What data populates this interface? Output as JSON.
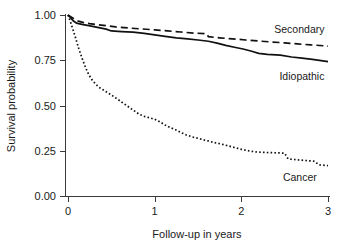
{
  "figure": {
    "background_color": "#ffffff",
    "line_color": "#111111"
  },
  "chart_data": {
    "type": "line",
    "title": "",
    "xlabel": "Follow-up in years",
    "ylabel": "Survival probability",
    "xlim": [
      0,
      3
    ],
    "ylim": [
      0,
      1
    ],
    "xticks": [
      0,
      1,
      2,
      3
    ],
    "xticklabels": [
      "0",
      "1",
      "2",
      "3"
    ],
    "yticks": [
      0.0,
      0.25,
      0.5,
      0.75,
      1.0
    ],
    "yticklabels": [
      "0.00",
      "0.25",
      "0.50",
      "0.75",
      "1.00"
    ],
    "grid": false,
    "legend_position": "inline-annotations",
    "series": [
      {
        "name": "Secondary",
        "style": "dashed",
        "label_x": 2.38,
        "label_y": 0.925,
        "points": [
          [
            0.0,
            1.0
          ],
          [
            0.04,
            0.988
          ],
          [
            0.08,
            0.975
          ],
          [
            0.12,
            0.966
          ],
          [
            0.18,
            0.958
          ],
          [
            0.25,
            0.952
          ],
          [
            0.35,
            0.946
          ],
          [
            0.45,
            0.94
          ],
          [
            0.55,
            0.934
          ],
          [
            0.7,
            0.928
          ],
          [
            0.85,
            0.923
          ],
          [
            1.0,
            0.918
          ],
          [
            1.15,
            0.912
          ],
          [
            1.3,
            0.906
          ],
          [
            1.45,
            0.9
          ],
          [
            1.6,
            0.897
          ],
          [
            1.62,
            0.88
          ],
          [
            1.75,
            0.874
          ],
          [
            1.9,
            0.868
          ],
          [
            2.05,
            0.862
          ],
          [
            2.2,
            0.856
          ],
          [
            2.35,
            0.851
          ],
          [
            2.5,
            0.846
          ],
          [
            2.65,
            0.84
          ],
          [
            2.8,
            0.835
          ],
          [
            2.95,
            0.83
          ],
          [
            3.0,
            0.828
          ]
        ]
      },
      {
        "name": "Idiopathic",
        "style": "solid",
        "label_x": 2.44,
        "label_y": 0.665,
        "points": [
          [
            0.0,
            1.0
          ],
          [
            0.03,
            0.985
          ],
          [
            0.06,
            0.968
          ],
          [
            0.1,
            0.955
          ],
          [
            0.16,
            0.948
          ],
          [
            0.24,
            0.941
          ],
          [
            0.34,
            0.932
          ],
          [
            0.44,
            0.922
          ],
          [
            0.5,
            0.912
          ],
          [
            0.62,
            0.908
          ],
          [
            0.75,
            0.905
          ],
          [
            0.88,
            0.898
          ],
          [
            1.0,
            0.89
          ],
          [
            1.12,
            0.882
          ],
          [
            1.25,
            0.874
          ],
          [
            1.38,
            0.868
          ],
          [
            1.5,
            0.862
          ],
          [
            1.62,
            0.855
          ],
          [
            1.72,
            0.845
          ],
          [
            1.82,
            0.832
          ],
          [
            1.92,
            0.822
          ],
          [
            2.02,
            0.812
          ],
          [
            2.12,
            0.8
          ],
          [
            2.2,
            0.788
          ],
          [
            2.3,
            0.782
          ],
          [
            2.45,
            0.778
          ],
          [
            2.58,
            0.768
          ],
          [
            2.7,
            0.762
          ],
          [
            2.82,
            0.755
          ],
          [
            2.92,
            0.748
          ],
          [
            3.0,
            0.742
          ]
        ]
      },
      {
        "name": "Cancer",
        "style": "dotted",
        "label_x": 2.48,
        "label_y": 0.105,
        "points": [
          [
            0.0,
            1.0
          ],
          [
            0.03,
            0.96
          ],
          [
            0.06,
            0.915
          ],
          [
            0.09,
            0.87
          ],
          [
            0.12,
            0.82
          ],
          [
            0.16,
            0.765
          ],
          [
            0.2,
            0.712
          ],
          [
            0.24,
            0.67
          ],
          [
            0.28,
            0.64
          ],
          [
            0.32,
            0.618
          ],
          [
            0.36,
            0.6
          ],
          [
            0.4,
            0.588
          ],
          [
            0.46,
            0.57
          ],
          [
            0.52,
            0.552
          ],
          [
            0.58,
            0.532
          ],
          [
            0.64,
            0.512
          ],
          [
            0.7,
            0.492
          ],
          [
            0.76,
            0.472
          ],
          [
            0.82,
            0.452
          ],
          [
            0.88,
            0.44
          ],
          [
            0.94,
            0.432
          ],
          [
            1.0,
            0.424
          ],
          [
            1.06,
            0.41
          ],
          [
            1.12,
            0.392
          ],
          [
            1.18,
            0.378
          ],
          [
            1.24,
            0.366
          ],
          [
            1.3,
            0.352
          ],
          [
            1.36,
            0.338
          ],
          [
            1.44,
            0.326
          ],
          [
            1.52,
            0.316
          ],
          [
            1.6,
            0.306
          ],
          [
            1.68,
            0.296
          ],
          [
            1.76,
            0.288
          ],
          [
            1.84,
            0.278
          ],
          [
            1.92,
            0.268
          ],
          [
            2.0,
            0.258
          ],
          [
            2.1,
            0.248
          ],
          [
            2.2,
            0.242
          ],
          [
            2.32,
            0.24
          ],
          [
            2.44,
            0.238
          ],
          [
            2.5,
            0.236
          ],
          [
            2.54,
            0.205
          ],
          [
            2.64,
            0.2
          ],
          [
            2.74,
            0.196
          ],
          [
            2.84,
            0.192
          ],
          [
            2.9,
            0.172
          ],
          [
            3.0,
            0.168
          ]
        ]
      }
    ]
  }
}
